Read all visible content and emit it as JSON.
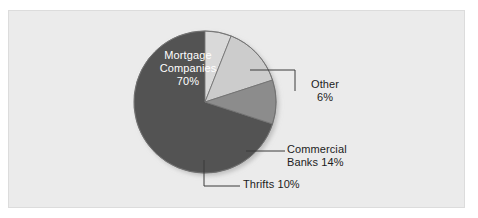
{
  "figure": {
    "panel_bg": "#ebebeb",
    "panel_border": "#dcdcdc",
    "page_bg": "#ffffff"
  },
  "chart_data": {
    "type": "pie",
    "title": "",
    "subtitle": "",
    "xlabel": "",
    "ylabel": "",
    "legend_position": "none",
    "grid": false,
    "units": "percent",
    "total": 100,
    "start_angle_deg": 0,
    "direction": "clockwise",
    "center": {
      "x": 205,
      "y": 102
    },
    "radius": 71,
    "categories": [
      "Other",
      "Commercial Banks",
      "Thrifts",
      "Mortgage Companies"
    ],
    "values": [
      6,
      14,
      10,
      70
    ],
    "labels": [
      "Other 6%",
      "Commercial Banks 14%",
      "Thrifts 10%",
      "Mortgage Companies 70%"
    ],
    "slices": [
      {
        "name": "Other",
        "value": 6,
        "percent_text": "6%",
        "color": "#d9d9d9",
        "start_deg": 0,
        "end_deg": 21.6,
        "label_placement": "outside"
      },
      {
        "name": "Commercial Banks",
        "value": 14,
        "percent_text": "14%",
        "color": "#cccccc",
        "start_deg": 21.6,
        "end_deg": 72,
        "label_placement": "outside"
      },
      {
        "name": "Thrifts",
        "value": 10,
        "percent_text": "10%",
        "color": "#8c8c8c",
        "start_deg": 72,
        "end_deg": 108,
        "label_placement": "outside"
      },
      {
        "name": "Mortgage Companies",
        "value": 70,
        "percent_text": "70%",
        "color": "#535353",
        "start_deg": 108,
        "end_deg": 360,
        "label_placement": "inside"
      }
    ],
    "colors": [
      "#d9d9d9",
      "#cccccc",
      "#8c8c8c",
      "#535353"
    ],
    "slice_outline_color": "#6e6e6e",
    "leader_line_color": "#3a3a3a"
  },
  "labels": {
    "mortgage": {
      "line1": "Mortgage",
      "line2": "Companies",
      "line3": "70%"
    },
    "other": {
      "line1": "Other",
      "line2": "6%"
    },
    "commercial": {
      "line1": "Commercial",
      "line2": "Banks 14%"
    },
    "thrifts": {
      "line1": "Thrifts 10%"
    }
  }
}
